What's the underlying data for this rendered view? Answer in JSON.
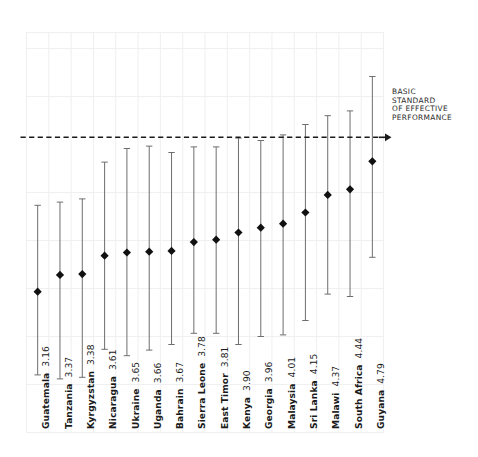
{
  "figure": {
    "background_color": "#ffffff",
    "grid_color": "#f0f0f2",
    "marker_color": "#111111",
    "whisker_color": "#6e6e6e",
    "reference_line_color": "#1a1a1a"
  },
  "annotation": {
    "name": "basic-standard-annotation",
    "lines": [
      "BASIC",
      "STANDARD",
      "OF EFFECTIVE",
      "PERFORMANCE"
    ],
    "arrow": "right-arrow"
  },
  "chart_data": {
    "type": "scatter",
    "title": "",
    "subtitle": "",
    "xlabel": "",
    "ylabel": "",
    "grid": true,
    "legend": null,
    "ylim": [
      1.4,
      6.4
    ],
    "reference_line": {
      "label": "BASIC STANDARD OF EFFECTIVE PERFORMANCE",
      "value": 5.09,
      "style": "dashed"
    },
    "categories": [
      "Guatemala",
      "Tanzania",
      "Kyrgyzstan",
      "Nicaragua",
      "Ukraine",
      "Uganda",
      "Bahrain",
      "Sierra Leone",
      "East Timor",
      "Kenya",
      "Georgia",
      "Malaysia",
      "Sri Lanka",
      "Malawi",
      "South Africa",
      "Guyana"
    ],
    "values": [
      3.16,
      3.37,
      3.38,
      3.61,
      3.65,
      3.66,
      3.67,
      3.78,
      3.81,
      3.9,
      3.96,
      4.01,
      4.15,
      4.37,
      4.44,
      4.79
    ],
    "value_labels": [
      "3.16",
      "3.37",
      "3.38",
      "3.61",
      "3.65",
      "3.66",
      "3.67",
      "3.78",
      "3.81",
      "3.90",
      "3.96",
      "4.01",
      "4.15",
      "4.37",
      "4.44",
      "4.79"
    ],
    "error_low": [
      2.12,
      2.07,
      2.09,
      2.44,
      2.36,
      2.43,
      2.5,
      2.64,
      2.64,
      2.5,
      2.6,
      2.62,
      2.8,
      3.13,
      3.1,
      3.59
    ],
    "error_high": [
      4.24,
      4.28,
      4.32,
      4.78,
      4.95,
      4.98,
      4.9,
      4.97,
      4.97,
      5.08,
      5.05,
      5.12,
      5.25,
      5.36,
      5.42,
      5.85
    ],
    "x_tick_labels": [
      "Guatemala 3.16",
      "Tanzania 3.37",
      "Kyrgyzstan 3.38",
      "Nicaragua 3.61",
      "Ukraine 3.65",
      "Uganda 3.66",
      "Bahrain 3.67",
      "Sierra Leone 3.78",
      "East Timor 3.81",
      "Kenya 3.90",
      "Georgia 3.96",
      "Malaysia 4.01",
      "Sri Lanka 4.15",
      "Malawi 4.37",
      "South Africa 4.44",
      "Guyana 4.79"
    ]
  }
}
